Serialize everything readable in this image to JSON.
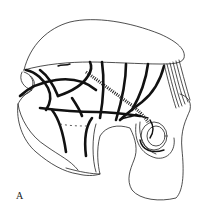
{
  "figure": {
    "panel_label": "A",
    "colors": {
      "background": "#ffffff",
      "line": "#111111"
    }
  }
}
